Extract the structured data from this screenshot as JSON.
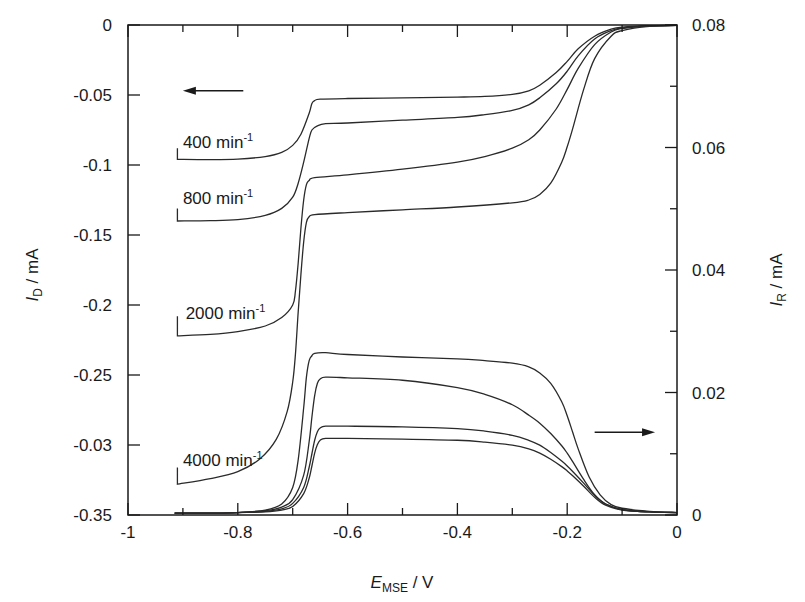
{
  "chart_data": {
    "type": "line",
    "title": "",
    "xlabel": "E_MSE / V",
    "xlabel_main": "E",
    "xlabel_sub": "MSE",
    "xlabel_unit": " / V",
    "ylabel_left": "I_D / mA",
    "ylabel_left_main": "I",
    "ylabel_left_sub": "D",
    "ylabel_left_unit": " / mA",
    "ylabel_right": "I_R / mA",
    "ylabel_right_main": "I",
    "ylabel_right_sub": "R",
    "ylabel_right_unit": " / mA",
    "xlim": [
      -1,
      0
    ],
    "ylim_left": [
      -0.35,
      0
    ],
    "ylim_right": [
      0,
      0.08
    ],
    "x_ticks": [
      {
        "value": -1,
        "label": "-1"
      },
      {
        "value": -0.8,
        "label": "-0.8"
      },
      {
        "value": -0.6,
        "label": "-0.6"
      },
      {
        "value": -0.4,
        "label": "-0.4"
      },
      {
        "value": -0.2,
        "label": "-0.2"
      },
      {
        "value": 0,
        "label": "0"
      }
    ],
    "x_minor_ticks": [
      -0.9,
      -0.7,
      -0.5,
      -0.3,
      -0.1
    ],
    "y_left_ticks": [
      {
        "value": 0,
        "label": "0"
      },
      {
        "value": -0.05,
        "label": "-0.05"
      },
      {
        "value": -0.1,
        "label": "-0.1"
      },
      {
        "value": -0.15,
        "label": "-0.15"
      },
      {
        "value": -0.2,
        "label": "-0.2"
      },
      {
        "value": -0.25,
        "label": "-0.25"
      },
      {
        "value": -0.3,
        "label": "-0.03"
      },
      {
        "value": -0.35,
        "label": "-0.35"
      }
    ],
    "y_right_ticks": [
      {
        "value": 0.08,
        "label": "0.08"
      },
      {
        "value": 0.06,
        "label": "0.06"
      },
      {
        "value": 0.04,
        "label": "0.04"
      },
      {
        "value": 0.02,
        "label": "0.02"
      },
      {
        "value": 0,
        "label": "0"
      }
    ],
    "y_right_minor_ticks": [
      0.07,
      0.05,
      0.03,
      0.01
    ],
    "grid": false,
    "legend": "none (inline labels)",
    "annotations": [
      {
        "text": "400 min",
        "sup": "-1",
        "x": -0.9,
        "y": -0.088
      },
      {
        "text": "800 min",
        "sup": "-1",
        "x": -0.9,
        "y": -0.128
      },
      {
        "text": "2000 min",
        "sup": "-1",
        "x": -0.895,
        "y": -0.21
      },
      {
        "text": "4000 min",
        "sup": "-1",
        "x": -0.9,
        "y": -0.315
      },
      {
        "text": "arrow-left (disk current, left axis)",
        "x_from": -0.79,
        "x_to": -0.9,
        "y": -0.047
      },
      {
        "text": "arrow-right (ring current, right axis)",
        "x_from": -0.15,
        "x_to": -0.04,
        "y_right": 0.0135
      }
    ],
    "series": [
      {
        "name": "Disk 400 min-1",
        "axis": "left",
        "x": [
          -0.91,
          -0.91,
          -0.85,
          -0.8,
          -0.75,
          -0.72,
          -0.7,
          -0.685,
          -0.67,
          -0.665,
          -0.66,
          -0.65,
          -0.6,
          -0.5,
          -0.4,
          -0.35,
          -0.3,
          -0.27,
          -0.25,
          -0.22,
          -0.2,
          -0.18,
          -0.15,
          -0.12,
          -0.1,
          -0.05,
          0
        ],
        "y": [
          -0.088,
          -0.096,
          -0.0962,
          -0.0958,
          -0.094,
          -0.091,
          -0.086,
          -0.078,
          -0.063,
          -0.056,
          -0.054,
          -0.053,
          -0.0525,
          -0.052,
          -0.0515,
          -0.051,
          -0.0495,
          -0.047,
          -0.043,
          -0.034,
          -0.026,
          -0.017,
          -0.008,
          -0.003,
          -0.0015,
          -0.0005,
          -0.0003
        ]
      },
      {
        "name": "Disk 800 min-1",
        "axis": "left",
        "x": [
          -0.91,
          -0.91,
          -0.85,
          -0.8,
          -0.75,
          -0.72,
          -0.7,
          -0.69,
          -0.68,
          -0.67,
          -0.665,
          -0.655,
          -0.64,
          -0.6,
          -0.5,
          -0.4,
          -0.35,
          -0.3,
          -0.27,
          -0.25,
          -0.22,
          -0.2,
          -0.18,
          -0.15,
          -0.12,
          -0.1,
          -0.05,
          0
        ],
        "y": [
          -0.131,
          -0.14,
          -0.1398,
          -0.139,
          -0.136,
          -0.131,
          -0.123,
          -0.113,
          -0.098,
          -0.081,
          -0.075,
          -0.072,
          -0.0705,
          -0.07,
          -0.068,
          -0.066,
          -0.064,
          -0.061,
          -0.057,
          -0.052,
          -0.042,
          -0.033,
          -0.022,
          -0.01,
          -0.004,
          -0.002,
          -0.0006,
          -0.0003
        ]
      },
      {
        "name": "Disk 2000 min-1",
        "axis": "left",
        "x": [
          -0.91,
          -0.91,
          -0.85,
          -0.8,
          -0.75,
          -0.72,
          -0.7,
          -0.695,
          -0.69,
          -0.685,
          -0.68,
          -0.675,
          -0.67,
          -0.66,
          -0.6,
          -0.5,
          -0.4,
          -0.35,
          -0.3,
          -0.27,
          -0.25,
          -0.22,
          -0.2,
          -0.18,
          -0.15,
          -0.12,
          -0.1,
          -0.05,
          0
        ],
        "y": [
          -0.208,
          -0.222,
          -0.221,
          -0.219,
          -0.215,
          -0.209,
          -0.2,
          -0.19,
          -0.17,
          -0.145,
          -0.125,
          -0.114,
          -0.111,
          -0.109,
          -0.107,
          -0.103,
          -0.098,
          -0.094,
          -0.088,
          -0.082,
          -0.075,
          -0.06,
          -0.046,
          -0.031,
          -0.014,
          -0.005,
          -0.0025,
          -0.0007,
          -0.0003
        ]
      },
      {
        "name": "Disk 4000 min-1",
        "axis": "left",
        "x": [
          -0.91,
          -0.91,
          -0.85,
          -0.8,
          -0.76,
          -0.73,
          -0.71,
          -0.7,
          -0.695,
          -0.69,
          -0.685,
          -0.68,
          -0.675,
          -0.67,
          -0.66,
          -0.6,
          -0.5,
          -0.4,
          -0.3,
          -0.27,
          -0.25,
          -0.23,
          -0.21,
          -0.2,
          -0.19,
          -0.17,
          -0.15,
          -0.12,
          -0.1,
          -0.05,
          0
        ],
        "y": [
          -0.316,
          -0.328,
          -0.324,
          -0.319,
          -0.31,
          -0.296,
          -0.276,
          -0.255,
          -0.235,
          -0.205,
          -0.178,
          -0.155,
          -0.141,
          -0.137,
          -0.1355,
          -0.134,
          -0.132,
          -0.13,
          -0.127,
          -0.125,
          -0.121,
          -0.113,
          -0.098,
          -0.087,
          -0.074,
          -0.046,
          -0.024,
          -0.008,
          -0.004,
          -0.001,
          -0.0003
        ]
      },
      {
        "name": "Ring 2000 min-1 (highest)",
        "axis": "right",
        "x": [
          -0.915,
          -0.85,
          -0.8,
          -0.75,
          -0.72,
          -0.7,
          -0.69,
          -0.68,
          -0.675,
          -0.67,
          -0.665,
          -0.66,
          -0.64,
          -0.6,
          -0.5,
          -0.4,
          -0.35,
          -0.3,
          -0.27,
          -0.25,
          -0.23,
          -0.21,
          -0.2,
          -0.19,
          -0.18,
          -0.16,
          -0.14,
          -0.12,
          -0.1,
          -0.05,
          0
        ],
        "y": [
          0.0003,
          0.0003,
          0.0004,
          0.0008,
          0.0018,
          0.0045,
          0.009,
          0.0175,
          0.0225,
          0.0252,
          0.026,
          0.0264,
          0.0265,
          0.0262,
          0.0258,
          0.0255,
          0.0252,
          0.0248,
          0.0242,
          0.0232,
          0.0215,
          0.0185,
          0.0162,
          0.0135,
          0.0108,
          0.0062,
          0.0033,
          0.0017,
          0.0011,
          0.0006,
          0.0004
        ]
      },
      {
        "name": "Ring 800 min-1",
        "axis": "right",
        "x": [
          -0.915,
          -0.85,
          -0.8,
          -0.75,
          -0.72,
          -0.7,
          -0.68,
          -0.67,
          -0.665,
          -0.66,
          -0.655,
          -0.65,
          -0.64,
          -0.6,
          -0.5,
          -0.4,
          -0.35,
          -0.3,
          -0.27,
          -0.25,
          -0.23,
          -0.21,
          -0.2,
          -0.19,
          -0.17,
          -0.15,
          -0.13,
          -0.1,
          -0.05,
          0
        ],
        "y": [
          0.0003,
          0.0003,
          0.0004,
          0.0007,
          0.0013,
          0.0025,
          0.0065,
          0.012,
          0.016,
          0.0195,
          0.0215,
          0.0222,
          0.0225,
          0.0224,
          0.022,
          0.0208,
          0.0197,
          0.018,
          0.0163,
          0.015,
          0.0133,
          0.0113,
          0.0101,
          0.0087,
          0.0058,
          0.0033,
          0.0018,
          0.0009,
          0.0005,
          0.0004
        ]
      },
      {
        "name": "Ring 4000 min-1",
        "axis": "right",
        "x": [
          -0.915,
          -0.85,
          -0.8,
          -0.75,
          -0.72,
          -0.7,
          -0.68,
          -0.67,
          -0.665,
          -0.66,
          -0.655,
          -0.65,
          -0.64,
          -0.6,
          -0.5,
          -0.4,
          -0.35,
          -0.3,
          -0.27,
          -0.25,
          -0.23,
          -0.21,
          -0.2,
          -0.19,
          -0.17,
          -0.15,
          -0.13,
          -0.1,
          -0.05,
          0
        ],
        "y": [
          0.0003,
          0.0003,
          0.0004,
          0.0006,
          0.001,
          0.0019,
          0.0045,
          0.0078,
          0.01,
          0.0122,
          0.0136,
          0.0142,
          0.0145,
          0.0145,
          0.0144,
          0.0141,
          0.0137,
          0.013,
          0.0122,
          0.0114,
          0.0102,
          0.0088,
          0.008,
          0.0071,
          0.0052,
          0.0032,
          0.0018,
          0.0009,
          0.0005,
          0.0004
        ]
      },
      {
        "name": "Ring 400 min-1 (lowest)",
        "axis": "right",
        "x": [
          -0.915,
          -0.85,
          -0.8,
          -0.75,
          -0.72,
          -0.7,
          -0.68,
          -0.67,
          -0.665,
          -0.66,
          -0.655,
          -0.65,
          -0.64,
          -0.6,
          -0.5,
          -0.4,
          -0.35,
          -0.3,
          -0.27,
          -0.25,
          -0.23,
          -0.21,
          -0.2,
          -0.19,
          -0.17,
          -0.15,
          -0.13,
          -0.1,
          -0.05,
          0
        ],
        "y": [
          0.0003,
          0.0003,
          0.0004,
          0.0005,
          0.0008,
          0.0014,
          0.0035,
          0.006,
          0.008,
          0.0101,
          0.0115,
          0.0122,
          0.0125,
          0.0125,
          0.0124,
          0.0122,
          0.0119,
          0.0114,
          0.0108,
          0.0101,
          0.0091,
          0.0079,
          0.0072,
          0.0064,
          0.0047,
          0.0029,
          0.0016,
          0.0008,
          0.0005,
          0.0004
        ]
      }
    ]
  },
  "colors": {
    "line": "#2a2a2a",
    "axis": "#1a1a1a",
    "background": "#ffffff"
  }
}
